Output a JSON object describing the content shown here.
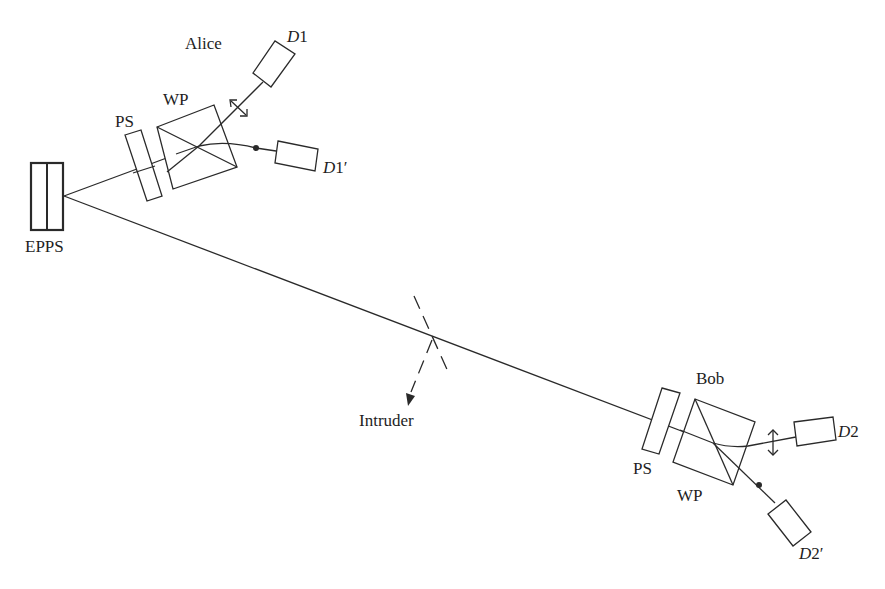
{
  "diagram": {
    "type": "quantum key distribution setup (entangled photon pairs)",
    "source": {
      "label": "EPPS"
    },
    "alice": {
      "label": "Alice",
      "phase_shifter_label": "PS",
      "wollaston_prism_label": "WP",
      "detector_1": {
        "label_main": "D",
        "label_sub": "1",
        "label_prime": ""
      },
      "detector_1_prime": {
        "label_main": "D",
        "label_sub": "1",
        "label_prime": "′"
      }
    },
    "bob": {
      "label": "Bob",
      "phase_shifter_label": "PS",
      "wollaston_prism_label": "WP",
      "detector_2": {
        "label_main": "D",
        "label_sub": "2",
        "label_prime": ""
      },
      "detector_2_prime": {
        "label_main": "D",
        "label_sub": "2",
        "label_prime": "′"
      }
    },
    "intruder": {
      "label": "Intruder"
    },
    "colors": {
      "line": "#2a2a2a",
      "background": "#ffffff",
      "text": "#1e1e1e"
    }
  }
}
